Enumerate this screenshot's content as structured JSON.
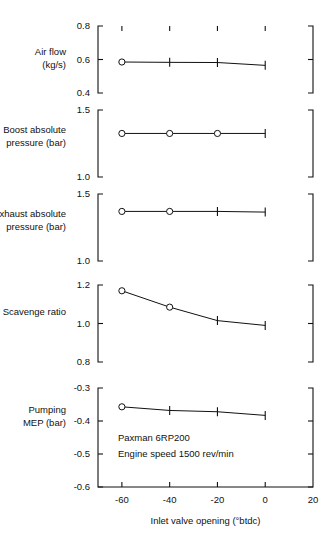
{
  "chart_data": {
    "type": "line",
    "title": "",
    "xlabel": "Inlet valve opening (°btdc)",
    "xlim": [
      -70,
      20
    ],
    "xticks": [
      -60,
      -40,
      -20,
      0,
      20
    ],
    "xticklabels": [
      "-60",
      "-40",
      "-20",
      "0",
      "20"
    ],
    "grid": false,
    "legend": null,
    "annotations": [
      "Paxman 6RP200",
      "Engine speed 1500 rev/min"
    ],
    "panels": [
      {
        "id": "air-flow",
        "ylabel_lines": [
          "Air flow",
          "(kg/s)"
        ],
        "ylabel": "Air flow (kg/s)",
        "ylim": [
          0.4,
          0.8
        ],
        "yticks": [
          0.4,
          0.6,
          0.8
        ],
        "yticklabels": [
          "0.4",
          "0.6",
          "0.8"
        ],
        "x": [
          -60,
          -40,
          -20,
          0
        ],
        "values": [
          0.585,
          0.583,
          0.582,
          0.565
        ],
        "markers": [
          "circle",
          "bar",
          "bar",
          "bar"
        ]
      },
      {
        "id": "boost-absolute-pressure",
        "ylabel_lines": [
          "Boost absolute",
          "pressure (bar)"
        ],
        "ylabel": "Boost absolute pressure (bar)",
        "ylim": [
          1.0,
          1.5
        ],
        "yticks": [
          1.0,
          1.5
        ],
        "yticklabels": [
          "1.0",
          "1.5"
        ],
        "x": [
          -60,
          -40,
          -20,
          0
        ],
        "values": [
          1.325,
          1.325,
          1.325,
          1.325
        ],
        "markers": [
          "circle",
          "circle",
          "circle",
          "bar"
        ]
      },
      {
        "id": "exhaust-absolute-pressure",
        "ylabel_lines": [
          "Exhaust absolute",
          "pressure (bar)"
        ],
        "ylabel": "Exhaust absolute pressure (bar)",
        "ylim": [
          1.0,
          1.5
        ],
        "yticks": [
          1.0,
          1.5
        ],
        "yticklabels": [
          "1.0",
          "1.5"
        ],
        "x": [
          -60,
          -40,
          -20,
          0
        ],
        "values": [
          1.37,
          1.37,
          1.37,
          1.365
        ],
        "markers": [
          "circle",
          "circle",
          "bar",
          "bar"
        ]
      },
      {
        "id": "scavenge-ratio",
        "ylabel_lines": [
          "Scavenge ratio"
        ],
        "ylabel": "Scavenge ratio",
        "ylim": [
          0.8,
          1.2
        ],
        "yticks": [
          0.8,
          1.0,
          1.2
        ],
        "yticklabels": [
          "0.8",
          "1.0",
          "1.2"
        ],
        "x": [
          -60,
          -40,
          -20,
          0
        ],
        "values": [
          1.17,
          1.085,
          1.015,
          0.99
        ],
        "markers": [
          "circle",
          "circle",
          "bar",
          "bar"
        ]
      },
      {
        "id": "pumping-mep",
        "ylabel_lines": [
          "Pumping",
          "MEP (bar)"
        ],
        "ylabel": "Pumping MEP (bar)",
        "ylim": [
          -0.6,
          -0.3
        ],
        "yticks": [
          -0.6,
          -0.5,
          -0.4,
          -0.3
        ],
        "yticklabels": [
          "-0.6",
          "-0.5",
          "-0.4",
          "-0.3"
        ],
        "x": [
          -60,
          -40,
          -20,
          0
        ],
        "values": [
          -0.357,
          -0.368,
          -0.372,
          -0.383
        ],
        "markers": [
          "circle",
          "bar",
          "bar",
          "bar"
        ]
      }
    ]
  }
}
